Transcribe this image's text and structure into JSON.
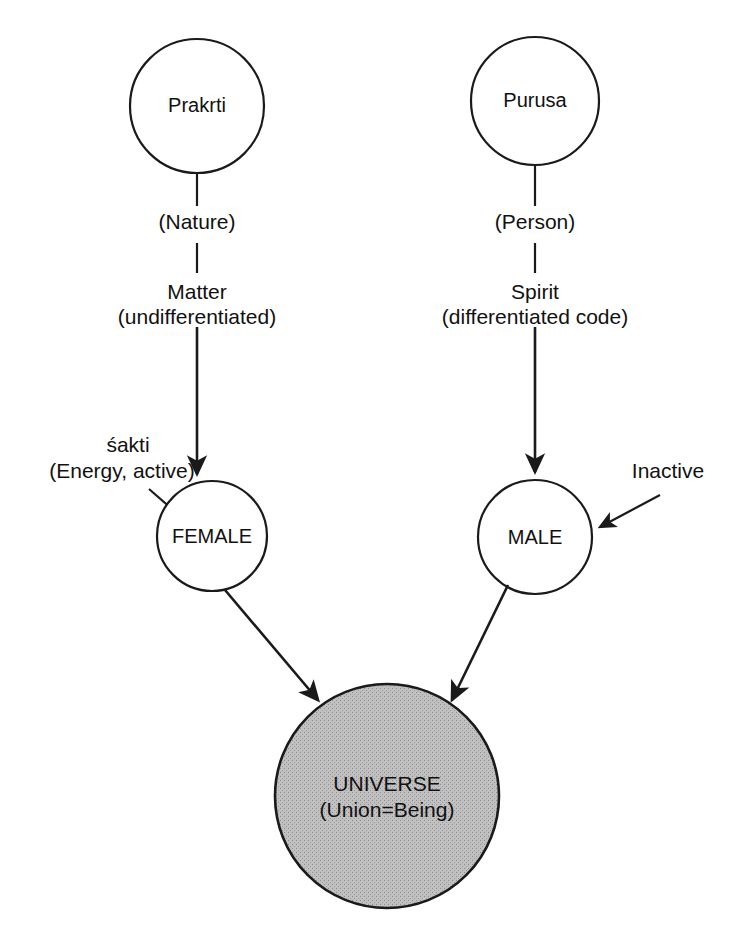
{
  "diagram": {
    "background_color": "#ffffff",
    "stroke_color": "#1a1a1a",
    "shaded_fill_color": "#bfbfbf"
  },
  "nodes": {
    "prakrti": {
      "label": "Prakrti"
    },
    "purusa": {
      "label": "Purusa"
    },
    "female": {
      "label": "FEMALE"
    },
    "male": {
      "label": "MALE"
    },
    "universe": {
      "line1": "UNIVERSE",
      "line2": "(Union=Being)"
    }
  },
  "edge_labels": {
    "nature": "(Nature)",
    "matter": "Matter",
    "matter_sub": "(undifferentiated)",
    "person": "(Person)",
    "spirit": "Spirit",
    "spirit_sub": "(differentiated  code)",
    "shakti": "śakti",
    "shakti_sub": "(Energy,  active)",
    "inactive": "Inactive"
  }
}
